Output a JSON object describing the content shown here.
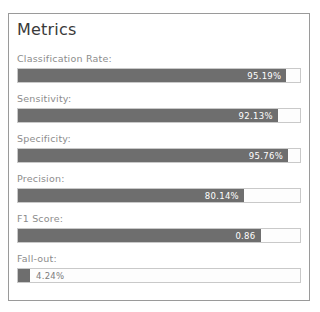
{
  "panel": {
    "title": "Metrics"
  },
  "metrics": [
    {
      "label": "Classification Rate:",
      "value_text": "95.19%",
      "percent": 95.19,
      "label_position": "inside"
    },
    {
      "label": "Sensitivity:",
      "value_text": "92.13%",
      "percent": 92.13,
      "label_position": "inside"
    },
    {
      "label": "Specificity:",
      "value_text": "95.76%",
      "percent": 95.76,
      "label_position": "inside"
    },
    {
      "label": "Precision:",
      "value_text": "80.14%",
      "percent": 80.14,
      "label_position": "inside"
    },
    {
      "label": "F1 Score:",
      "value_text": "0.86",
      "percent": 86.0,
      "label_position": "inside"
    },
    {
      "label": "Fall-out:",
      "value_text": "4.24%",
      "percent": 4.24,
      "label_position": "outside"
    }
  ],
  "colors": {
    "bar_fill": "#6e6e6e",
    "track_border": "#c9c9c9",
    "panel_border": "#9a9a9a",
    "label_text": "#8c8c8c",
    "title_text": "#3a3a3a",
    "value_text_inside": "#ffffff",
    "value_text_outside": "#7b7b7b",
    "background": "#ffffff"
  }
}
